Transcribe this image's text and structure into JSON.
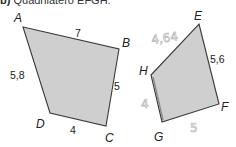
{
  "header": {
    "item_letter": "b)",
    "title": "Quadrilátero EFGH."
  },
  "figures": [
    {
      "name": "ABCD",
      "fill": "#cfcfcf",
      "stroke": "#3a3a3a",
      "vertices": [
        {
          "label": "A",
          "x": 23,
          "y": 27,
          "lx": 14,
          "ly": 22
        },
        {
          "label": "B",
          "x": 119,
          "y": 49,
          "lx": 122,
          "ly": 47
        },
        {
          "label": "C",
          "x": 106,
          "y": 126,
          "lx": 105,
          "ly": 142
        },
        {
          "label": "D",
          "x": 50,
          "y": 113,
          "lx": 36,
          "ly": 128
        }
      ],
      "sides": [
        {
          "between": "AB",
          "value": "7",
          "x": 75,
          "y": 37
        },
        {
          "between": "BC",
          "value": "5",
          "x": 114,
          "y": 90
        },
        {
          "between": "AD",
          "value": "5,8",
          "x": 10,
          "y": 79
        },
        {
          "between": "DC",
          "value": "4",
          "x": 70,
          "y": 134
        }
      ]
    },
    {
      "name": "EFGH",
      "fill": "#cfcfcf",
      "stroke": "#3a3a3a",
      "vertices": [
        {
          "label": "E",
          "x": 199,
          "y": 24,
          "lx": 194,
          "ly": 20
        },
        {
          "label": "F",
          "x": 219,
          "y": 104,
          "lx": 221,
          "ly": 111
        },
        {
          "label": "G",
          "x": 162,
          "y": 122,
          "lx": 154,
          "ly": 141
        },
        {
          "label": "H",
          "x": 151,
          "y": 75,
          "lx": 139,
          "ly": 75
        }
      ],
      "sides": [
        {
          "between": "EF",
          "value": "5,6",
          "x": 210,
          "y": 63
        }
      ],
      "handwritten": [
        {
          "between": "HE",
          "value": "4,64",
          "x": 152,
          "y": 44,
          "rotate": -8
        },
        {
          "between": "HG",
          "value": "4",
          "x": 141,
          "y": 108,
          "rotate": 0
        },
        {
          "between": "GF",
          "value": "5",
          "x": 190,
          "y": 132,
          "rotate": 0
        }
      ]
    }
  ]
}
